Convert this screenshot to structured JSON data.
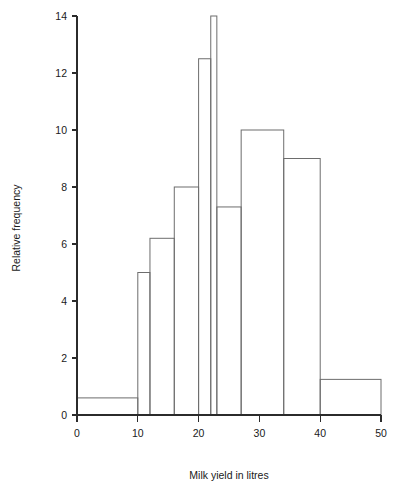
{
  "chart_data": {
    "type": "bar",
    "title": "",
    "subtitle": "",
    "xlabel": "Milk yield in litres",
    "ylabel": "Relative frequency",
    "xlim": [
      0,
      50
    ],
    "ylim": [
      0,
      14
    ],
    "grid": false,
    "legend": null,
    "xticks": [
      "0",
      "10",
      "20",
      "30",
      "40",
      "50"
    ],
    "xtick_values": [
      0,
      10,
      20,
      30,
      40,
      50
    ],
    "yticks": [
      "0",
      "2",
      "4",
      "6",
      "8",
      "10",
      "12",
      "14"
    ],
    "ytick_values": [
      0,
      2,
      4,
      6,
      8,
      10,
      12,
      14
    ],
    "bin_edges": [
      0,
      10,
      12,
      16,
      20,
      22,
      23,
      27,
      34,
      40,
      50
    ],
    "categories": [
      "0-10",
      "10-12",
      "12-16",
      "16-20",
      "20-22",
      "22-23",
      "23-27",
      "27-34",
      "34-40",
      "40-50"
    ],
    "values": [
      0.6,
      5.0,
      6.2,
      8.0,
      12.5,
      14.0,
      7.3,
      10.0,
      9.0,
      1.25
    ],
    "bars": [
      {
        "x0": 0,
        "x1": 10,
        "height": 0.6
      },
      {
        "x0": 10,
        "x1": 12,
        "height": 5.0
      },
      {
        "x0": 12,
        "x1": 16,
        "height": 6.2
      },
      {
        "x0": 16,
        "x1": 20,
        "height": 8.0
      },
      {
        "x0": 20,
        "x1": 22,
        "height": 12.5
      },
      {
        "x0": 22,
        "x1": 23,
        "height": 14.0
      },
      {
        "x0": 23,
        "x1": 27,
        "height": 7.3
      },
      {
        "x0": 27,
        "x1": 34,
        "height": 10.0
      },
      {
        "x0": 34,
        "x1": 40,
        "height": 9.0
      },
      {
        "x0": 40,
        "x1": 50,
        "height": 1.25
      }
    ],
    "colors": {
      "bar_stroke": "#6d6d6d",
      "bar_fill": "#ffffff",
      "axis": "#2b2b2b",
      "text": "#1a1a1a",
      "background": "#ffffff"
    }
  }
}
